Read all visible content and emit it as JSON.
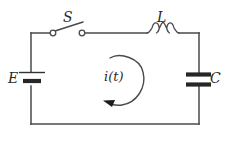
{
  "diagram": {
    "kind": "electrical-circuit-schematic",
    "width": 230,
    "height": 141,
    "background_color": "#ffffff",
    "wire_color": "#4a4a4a",
    "plate_color": "#262626",
    "label_color": "#2b2b2b"
  },
  "components": {
    "switch": {
      "name": "switch",
      "label": "S",
      "state": "open",
      "position": "top-left",
      "symbol": "knife-switch-open"
    },
    "inductor": {
      "name": "inductor",
      "label": "L",
      "position": "top-right",
      "symbol": "coil-three-loops",
      "loop_count": 3
    },
    "battery": {
      "name": "battery",
      "label": "E",
      "position": "left",
      "symbol": "battery-cell",
      "plates": 2
    },
    "capacitor": {
      "name": "capacitor",
      "label": "C",
      "position": "right",
      "symbol": "capacitor-parallel-plates",
      "plates": 2
    },
    "current": {
      "name": "current",
      "label": "i(t)",
      "position": "center",
      "symbol": "circular-arrow",
      "direction": "counterclockwise"
    }
  },
  "loop": {
    "left_x": 31,
    "right_x": 199,
    "top_y": 33,
    "bottom_y": 124
  }
}
